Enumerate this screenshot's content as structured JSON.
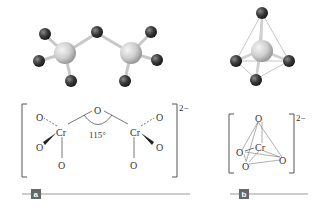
{
  "diagram": {
    "panels": [
      {
        "label": "a",
        "species": "dichromate ion",
        "charge": "2−",
        "structure": {
          "center_atoms": [
            "Cr",
            "Cr"
          ],
          "bridge_atom": "O",
          "terminal_atoms_left": [
            "O",
            "O",
            "O"
          ],
          "terminal_atoms_right": [
            "O",
            "O",
            "O"
          ],
          "bridge_angle": "115°"
        }
      },
      {
        "label": "b",
        "species": "tetrahedral unit",
        "charge": "2−",
        "structure": {
          "center_atom": "Cr",
          "vertex_atoms": [
            "O",
            "O",
            "O",
            "O"
          ]
        }
      }
    ],
    "colors": {
      "cr_atom": "#d0d0d0",
      "o_atom": "#3a3a3a",
      "bond": "#c8c8c8",
      "line": "#777777",
      "label_box": "#666666"
    }
  }
}
